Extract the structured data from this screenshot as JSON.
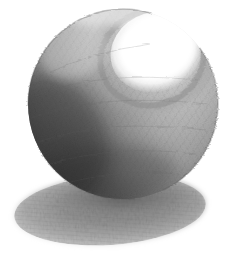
{
  "artwork": {
    "title": "Shaded Sphere",
    "medium": "graphite pencil on white paper",
    "subject": "sphere-with-cast-shadow",
    "caption": "Pencil drawing of a sphere rendered with graduated shading, a bright specular highlight at the upper right, a dark core shadow along the lower left, and a soft elliptical cast shadow on the ground plane.",
    "canvas": {
      "width": 237,
      "height": 257,
      "background_color": "#ffffff",
      "paper_color": "#ffffff"
    },
    "palette": {
      "paper_white": "#ffffff",
      "highlight_white": "#fefefe",
      "light_tone": "#e3e3e3",
      "mid_tone": "#a8a8a8",
      "core_shadow": "#4a4a4a",
      "darkest_tone": "#2f2f2f",
      "reflected_light": "#8c8c8c",
      "cast_shadow_tone": "#9a9a9a",
      "cast_shadow_core": "#7c7c7c",
      "contour_line": "#6b6b6b"
    },
    "elements": [
      {
        "name": "sphere",
        "shape": "circle",
        "center_x": 123,
        "center_y": 104,
        "radius": 95,
        "bounds": {
          "left": 28,
          "top": 10,
          "right": 218,
          "bottom": 198
        }
      },
      {
        "name": "specular-highlight",
        "shape": "ellipse",
        "center_x": 156,
        "center_y": 52,
        "radius_x": 46,
        "radius_y": 40,
        "rotation_deg": -18,
        "tone": "#ffffff"
      },
      {
        "name": "highlight-rim",
        "shape": "crescent-arc",
        "description": "darker graphite ring encircling the lower-left edge of the highlight",
        "tone": "#b5b5b5"
      },
      {
        "name": "core-shadow",
        "shape": "crescent",
        "description": "darkest band along the lower-left limb of the sphere",
        "tone": "#2f2f2f"
      },
      {
        "name": "reflected-light",
        "shape": "arc",
        "description": "faint lighter band inside the lower-right silhouette edge",
        "tone": "#8c8c8c"
      },
      {
        "name": "cast-shadow",
        "shape": "ellipse",
        "center_x": 110,
        "center_y": 210,
        "radius_x": 96,
        "radius_y": 35,
        "rotation_deg": -4,
        "bounds": {
          "left": 14,
          "top": 176,
          "right": 206,
          "bottom": 244
        },
        "tone": "#9a9a9a"
      }
    ],
    "lighting": {
      "source_direction": "upper-right",
      "highlight_position": "upper-right",
      "shadow_direction": "lower-left",
      "notes": "single light source producing a hard specular highlight and a soft elliptical cast shadow"
    }
  }
}
